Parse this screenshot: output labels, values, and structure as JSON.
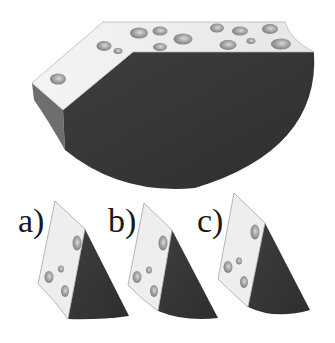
{
  "figure": {
    "colors": {
      "light_face": "#ececec",
      "dark_face": "#3a3a3a",
      "side_face": "#7a7a7a",
      "hole": "#9a9a9a",
      "label": "#1a1a1a"
    }
  },
  "options": [
    {
      "label": "a)"
    },
    {
      "label": "b)"
    },
    {
      "label": "c)"
    }
  ]
}
